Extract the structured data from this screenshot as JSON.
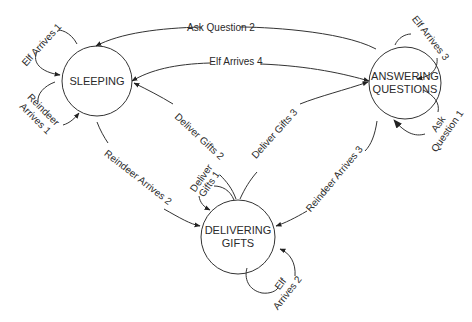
{
  "diagram": {
    "type": "state-machine",
    "colors": {
      "stroke": "#333333",
      "text": "#2a2a2a",
      "background": "#ffffff"
    },
    "states": [
      {
        "id": "sleeping",
        "lines": [
          "SLEEPING"
        ]
      },
      {
        "id": "answering",
        "lines": [
          "ANSWERING",
          "QUESTIONS"
        ]
      },
      {
        "id": "delivering",
        "lines": [
          "DELIVERING",
          "GIFTS"
        ]
      }
    ],
    "transitions": [
      {
        "from": "sleeping",
        "to": "sleeping",
        "label": "Elf Arrives 1"
      },
      {
        "from": "sleeping",
        "to": "sleeping",
        "label_lines": [
          "Reindeer",
          "Arrives 1"
        ]
      },
      {
        "from": "answering",
        "to": "sleeping",
        "label": "Ask Question 2"
      },
      {
        "from": "sleeping",
        "to": "answering",
        "label": "Elf Arrives 4"
      },
      {
        "from": "delivering",
        "to": "sleeping",
        "label": "Deliver Gifts 2"
      },
      {
        "from": "delivering",
        "to": "answering",
        "label": "Deliver Gifts 3"
      },
      {
        "from": "delivering",
        "to": "delivering",
        "label_lines": [
          "Deliver",
          "Gifts 1"
        ]
      },
      {
        "from": "sleeping",
        "to": "delivering",
        "label": "Reindeer Arrives 2"
      },
      {
        "from": "answering",
        "to": "delivering",
        "label": "Reindeer Arrives 3"
      },
      {
        "from": "answering",
        "to": "answering",
        "label": "Elf Arrives 3"
      },
      {
        "from": "answering",
        "to": "answering",
        "label_lines": [
          "Ask",
          "Question 1"
        ]
      },
      {
        "from": "delivering",
        "to": "delivering",
        "label_lines": [
          "Elf",
          "Arrives 2"
        ]
      }
    ]
  }
}
